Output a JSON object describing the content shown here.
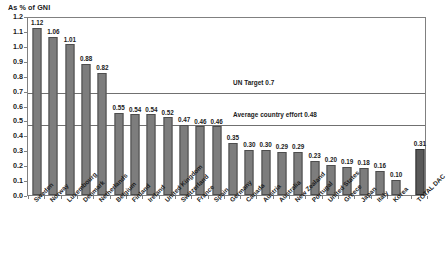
{
  "chart_data": {
    "type": "bar",
    "title": "As % of GNI",
    "xlabel": "",
    "ylabel": "As % of GNI",
    "ylim": [
      0.0,
      1.2
    ],
    "ytick_step": 0.1,
    "grid": false,
    "legend": "none",
    "bar_color": "#7d7d7d",
    "total_bar_color": "#595959",
    "categories": [
      "Sweden",
      "Norway",
      "Luxembourg",
      "Denmark",
      "Netherlands",
      "Belgium",
      "Finland",
      "Ireland",
      "United Kingdom",
      "Switzerland",
      "France",
      "Spain",
      "Germany",
      "Canada",
      "Austria",
      "Australia",
      "New Zealand",
      "Portugal",
      "United States",
      "Greece",
      "Japan",
      "Italy",
      "Korea",
      "TOTAL DAC"
    ],
    "values": [
      1.12,
      1.06,
      1.01,
      0.88,
      0.82,
      0.55,
      0.54,
      0.54,
      0.52,
      0.47,
      0.46,
      0.46,
      0.35,
      0.3,
      0.3,
      0.29,
      0.29,
      0.23,
      0.2,
      0.19,
      0.18,
      0.16,
      0.1,
      0.31
    ],
    "value_labels": [
      "1.12",
      "1.06",
      "1.01",
      "0.88",
      "0.82",
      "0.55",
      "0.54",
      "0.54",
      "0.52",
      "0.47",
      "0.46",
      "0.46",
      "0.35",
      "0.30",
      "0.30",
      "0.29",
      "0.29",
      "0.23",
      "0.20",
      "0.19",
      "0.18",
      "0.16",
      "0.10",
      "0.31"
    ],
    "ytick_labels": [
      "0.0",
      "0.1",
      "0.2",
      "0.3",
      "0.4",
      "0.5",
      "0.6",
      "0.7",
      "0.8",
      "0.9",
      "1.0",
      "1.1",
      "1.2"
    ],
    "reference_lines": [
      {
        "value": 0.7,
        "label": "UN Target 0.7",
        "color": "#707070"
      },
      {
        "value": 0.48,
        "label": "Average country effort 0.48",
        "color": "#707070"
      }
    ]
  }
}
